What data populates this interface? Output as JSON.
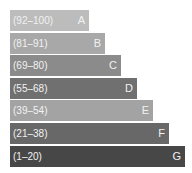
{
  "chart_data": {
    "type": "bar",
    "orientation": "horizontal",
    "title": "",
    "categories": [
      "A",
      "B",
      "C",
      "D",
      "E",
      "F",
      "G"
    ],
    "bands": [
      {
        "range": "(92–100)",
        "letter": "A",
        "min": 92,
        "max": 100,
        "color": "#bcbcbc"
      },
      {
        "range": "(81–91)",
        "letter": "B",
        "min": 81,
        "max": 91,
        "color": "#a8a8a8"
      },
      {
        "range": "(69–80)",
        "letter": "C",
        "min": 69,
        "max": 80,
        "color": "#8b8b8b"
      },
      {
        "range": "(55–68)",
        "letter": "D",
        "min": 55,
        "max": 68,
        "color": "#707070"
      },
      {
        "range": "(39–54)",
        "letter": "E",
        "min": 39,
        "max": 54,
        "color": "#a3a3a3"
      },
      {
        "range": "(21–38)",
        "letter": "F",
        "min": 21,
        "max": 38,
        "color": "#686868"
      },
      {
        "range": "(1–20)",
        "letter": "G",
        "min": 1,
        "max": 20,
        "color": "#474747"
      }
    ],
    "relative_lengths": [
      1,
      2,
      3,
      4,
      5,
      6,
      7
    ],
    "grid": false,
    "legend": "none"
  }
}
